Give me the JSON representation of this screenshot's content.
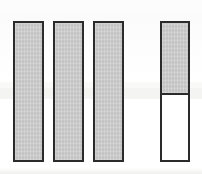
{
  "figure": {
    "title": "",
    "width": 202,
    "height": 174,
    "background_color": "#ffffff",
    "border_color": "#2b2b2b",
    "fill_color": "#c9c9c9",
    "empty_color": "#ffffff",
    "scan_band_color": "#f2f2f0"
  },
  "chart_data": {
    "type": "bar",
    "title": "",
    "xlabel": "",
    "ylabel": "",
    "grid": false,
    "legend": null,
    "axis_visible": false,
    "tick_labels": [],
    "categories": [
      "1",
      "2",
      "3",
      "4"
    ],
    "values": [
      100,
      100,
      100,
      100
    ],
    "ylim": [
      0,
      100
    ],
    "series": [
      {
        "name": "filled",
        "values": [
          100,
          100,
          100,
          52
        ]
      },
      {
        "name": "unfilled",
        "values": [
          0,
          0,
          0,
          48
        ]
      }
    ],
    "bars": [
      {
        "index": 1,
        "label": "",
        "x": 13,
        "width": 31,
        "top": 21,
        "height": 141,
        "filled_fraction": 1.0,
        "split_y": null,
        "state": "full"
      },
      {
        "index": 2,
        "label": "",
        "x": 53,
        "width": 31,
        "top": 21,
        "height": 141,
        "filled_fraction": 1.0,
        "split_y": null,
        "state": "full"
      },
      {
        "index": 3,
        "label": "",
        "x": 93,
        "width": 31,
        "top": 21,
        "height": 141,
        "filled_fraction": 1.0,
        "split_y": null,
        "state": "full"
      },
      {
        "index": 4,
        "label": "",
        "x": 160,
        "width": 30,
        "top": 21,
        "height": 141,
        "filled_fraction": 0.52,
        "split_y": 95,
        "state": "partial"
      }
    ],
    "gap_between_3_and_4": 36,
    "gap_between_bars": 9
  },
  "scan_artifacts": {
    "horizontal_band_top": 88,
    "horizontal_band_height": 11,
    "description": "faint lighter horizontal band across the middle of the scan"
  }
}
